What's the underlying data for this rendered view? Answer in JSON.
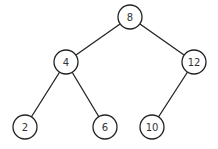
{
  "diagram": {
    "type": "binary-search-tree",
    "nodes": [
      {
        "id": "n8",
        "label": "8",
        "x": 130,
        "y": 17
      },
      {
        "id": "n4",
        "label": "4",
        "x": 66,
        "y": 62
      },
      {
        "id": "n12",
        "label": "12",
        "x": 194,
        "y": 62
      },
      {
        "id": "n2",
        "label": "2",
        "x": 25,
        "y": 127
      },
      {
        "id": "n6",
        "label": "6",
        "x": 105,
        "y": 127
      },
      {
        "id": "n10",
        "label": "10",
        "x": 152,
        "y": 127
      }
    ],
    "edges": [
      {
        "from": "n8",
        "to": "n4"
      },
      {
        "from": "n8",
        "to": "n12"
      },
      {
        "from": "n4",
        "to": "n2"
      },
      {
        "from": "n4",
        "to": "n6"
      },
      {
        "from": "n12",
        "to": "n10"
      }
    ],
    "node_radius": 12
  }
}
